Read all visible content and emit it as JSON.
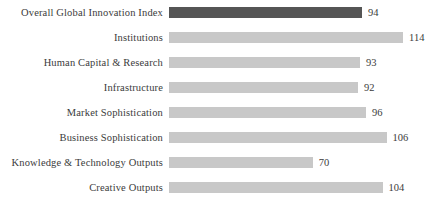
{
  "chart_data": {
    "type": "bar",
    "orientation": "horizontal",
    "title": "",
    "subtitle": "",
    "xlabel": "",
    "ylabel": "",
    "grid": false,
    "legend": "none",
    "xlim": [
      0,
      120
    ],
    "axis_visible": false,
    "tick_labels": [],
    "value_labels_shown": true,
    "categories": [
      "Overall Global Innovation Index",
      "Institutions",
      "Human Capital & Research",
      "Infrastructure",
      "Market Sophistication",
      "Business Sophistication",
      "Knowledge & Technology Outputs",
      "Creative Outputs"
    ],
    "values": [
      94,
      114,
      93,
      92,
      96,
      106,
      70,
      104
    ],
    "value_text": [
      "94",
      "114",
      "93",
      "92",
      "96",
      "106",
      "70",
      "104"
    ],
    "colors": {
      "accent_bar": "#555555",
      "default_bar": "#c8c8c8",
      "text": "#3b3b3b",
      "background": "#ffffff"
    },
    "highlighted_index": 0,
    "bars": [
      {
        "label": "Overall Global Innovation Index",
        "value": 94,
        "value_text": "94",
        "color": "#555555",
        "highlighted": true
      },
      {
        "label": "Institutions",
        "value": 114,
        "value_text": "114",
        "color": "#c8c8c8",
        "highlighted": false
      },
      {
        "label": "Human Capital & Research",
        "value": 93,
        "value_text": "93",
        "color": "#c8c8c8",
        "highlighted": false
      },
      {
        "label": "Infrastructure",
        "value": 92,
        "value_text": "92",
        "color": "#c8c8c8",
        "highlighted": false
      },
      {
        "label": "Market Sophistication",
        "value": 96,
        "value_text": "96",
        "color": "#c8c8c8",
        "highlighted": false
      },
      {
        "label": "Business Sophistication",
        "value": 106,
        "value_text": "106",
        "color": "#c8c8c8",
        "highlighted": false
      },
      {
        "label": "Knowledge & Technology Outputs",
        "value": 70,
        "value_text": "70",
        "color": "#c8c8c8",
        "highlighted": false
      },
      {
        "label": "Creative Outputs",
        "value": 104,
        "value_text": "104",
        "color": "#c8c8c8",
        "highlighted": false
      }
    ]
  }
}
